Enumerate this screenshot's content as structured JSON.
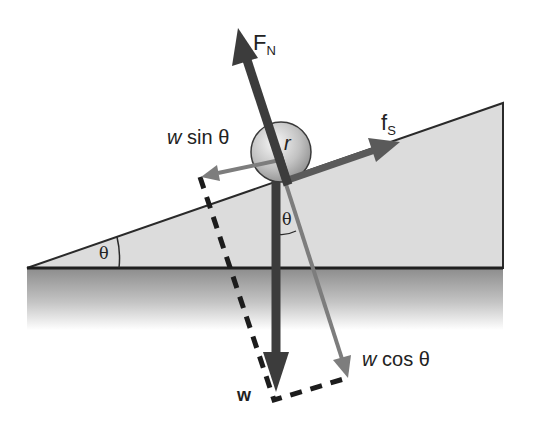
{
  "diagram": {
    "labels": {
      "normal_force": {
        "main": "F",
        "sub": "N"
      },
      "static_friction": {
        "main": "f",
        "sub": "S"
      },
      "w_sin": {
        "var": "w",
        "text": "sin θ"
      },
      "w_cos": {
        "var": "w",
        "text": "cos θ"
      },
      "weight": "w",
      "radius": "r",
      "angle_incline": "θ",
      "angle_vertical": "θ"
    },
    "colors": {
      "dark_arrow": "#3c3c3c",
      "gray_arrow": "#7d7d7d",
      "incline_fill": "#dcdcdc",
      "outline": "#2a2a2a",
      "ground_top": "#8e8e8e",
      "ground_bottom": "#ffffff",
      "ball_light": "#f2f2f2",
      "ball_dark": "#9a9a9a"
    }
  }
}
